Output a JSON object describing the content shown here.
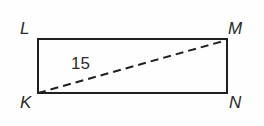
{
  "figure": {
    "type": "rectangle-with-diagonal",
    "background_color": "#fefefe",
    "stroke_color": "#231f20",
    "text_color": "#2b2b2b",
    "stroke_width": 2,
    "rectangle": {
      "name": "rectangle-KLMN",
      "x": 38,
      "y": 39,
      "width": 189,
      "height": 54,
      "corners": {
        "top_left": {
          "x": 38,
          "y": 39
        },
        "top_right": {
          "x": 227,
          "y": 39
        },
        "bottom_right": {
          "x": 227,
          "y": 93
        },
        "bottom_left": {
          "x": 38,
          "y": 93
        }
      }
    },
    "diagonal": {
      "name": "diagonal-KM",
      "style": "dashed",
      "dash_pattern": "8 5",
      "from": {
        "x": 38,
        "y": 93
      },
      "to": {
        "x": 227,
        "y": 40
      }
    },
    "vertices": [
      {
        "id": "L",
        "label": "L",
        "position": "top-left"
      },
      {
        "id": "M",
        "label": "M",
        "position": "top-right"
      },
      {
        "id": "K",
        "label": "K",
        "position": "bottom-left"
      },
      {
        "id": "N",
        "label": "N",
        "position": "bottom-right"
      }
    ],
    "measurements": [
      {
        "id": "diagonal-length",
        "label": "15",
        "applies_to": "diagonal-KM"
      }
    ]
  }
}
